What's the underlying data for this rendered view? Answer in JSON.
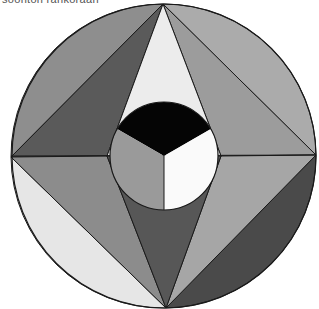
{
  "caption": {
    "text": "soonton rankoraan",
    "clipped": true
  },
  "diagram": {
    "type": "geometric-figure",
    "outer_circle": {
      "cx": 164,
      "cy": 156,
      "r": 152
    },
    "vertices": {
      "top": [
        163,
        4
      ],
      "right": [
        316,
        155
      ],
      "bottom": [
        166,
        308
      ],
      "left": [
        11,
        157
      ],
      "inner_left": [
        107,
        156
      ],
      "inner_right": [
        221,
        156
      ]
    },
    "inner_circle": {
      "cx": 164,
      "cy": 156,
      "r": 54
    },
    "colors": {
      "outline": "#1a1a1a",
      "upper_left_segment": "#8e8e8e",
      "upper_left_triangle": "#5a5a5a",
      "top_center": "#ececec",
      "upper_right_triangle": "#9c9c9c",
      "upper_right_segment": "#ababab",
      "lower_right_triangle": "#a6a6a6",
      "lower_right_segment": "#4a4a4a",
      "bottom_center": "#575757",
      "lower_left_triangle": "#8c8c8c",
      "lower_left_segment": "#e6e6e6",
      "sector_top": "#050505",
      "sector_left": "#9a9a9a",
      "sector_right": "#fafafa"
    },
    "center_sectors": [
      {
        "name": "top",
        "color": "black"
      },
      {
        "name": "lower-left",
        "color": "gray"
      },
      {
        "name": "lower-right",
        "color": "white"
      }
    ]
  }
}
